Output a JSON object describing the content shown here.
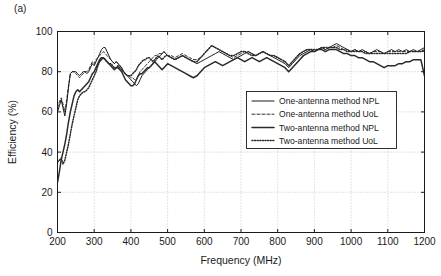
{
  "figure": {
    "panel_label": "(a)",
    "background_color": "#ffffff",
    "axis_color": "#1a1a1a",
    "grid_color": "#b0b0b0"
  },
  "chart_data": {
    "type": "line",
    "title": "",
    "panel_label": "(a)",
    "xlabel": "Frequency (MHz)",
    "ylabel": "Efficiency (%)",
    "xlim": [
      200,
      1200
    ],
    "ylim": [
      0,
      100
    ],
    "xticks": [
      200,
      300,
      400,
      500,
      600,
      700,
      800,
      900,
      1000,
      1100,
      1200
    ],
    "yticks": [
      0,
      20,
      40,
      60,
      80,
      100
    ],
    "grid": true,
    "grid_style": "dotted",
    "legend_position": "center-right",
    "x": [
      200,
      205,
      210,
      215,
      220,
      225,
      230,
      235,
      240,
      245,
      250,
      255,
      260,
      265,
      270,
      275,
      280,
      285,
      290,
      295,
      300,
      305,
      310,
      315,
      320,
      325,
      330,
      335,
      340,
      345,
      350,
      355,
      360,
      365,
      370,
      375,
      380,
      385,
      390,
      395,
      400,
      405,
      410,
      415,
      420,
      425,
      430,
      435,
      440,
      445,
      450,
      455,
      460,
      465,
      470,
      475,
      480,
      485,
      490,
      495,
      500,
      510,
      520,
      530,
      540,
      550,
      560,
      570,
      580,
      590,
      600,
      610,
      620,
      630,
      640,
      650,
      660,
      670,
      680,
      690,
      700,
      710,
      720,
      730,
      740,
      750,
      760,
      770,
      780,
      790,
      800,
      810,
      820,
      830,
      840,
      850,
      860,
      870,
      880,
      890,
      900,
      910,
      920,
      930,
      940,
      950,
      960,
      970,
      980,
      990,
      1000,
      1010,
      1020,
      1030,
      1040,
      1050,
      1060,
      1070,
      1080,
      1090,
      1100,
      1110,
      1120,
      1130,
      1140,
      1150,
      1160,
      1170,
      1180,
      1190,
      1200
    ],
    "series": [
      {
        "name": "One-antenna method NPL",
        "style": "solid",
        "color": "#1a1a1a",
        "width": 1.0,
        "values": [
          60,
          63,
          66,
          62,
          58,
          64,
          72,
          79,
          80,
          80,
          80,
          79,
          78,
          79,
          80,
          80,
          79,
          80,
          82,
          84,
          83,
          85,
          87,
          89,
          91,
          92,
          92,
          90,
          88,
          86,
          85,
          84,
          85,
          84,
          83,
          82,
          80,
          79,
          78,
          77,
          76,
          75,
          74,
          73,
          74,
          76,
          78,
          79,
          80,
          81,
          82,
          83,
          84,
          85,
          86,
          87,
          88,
          89,
          90,
          89,
          88,
          87,
          86,
          87,
          88,
          87,
          86,
          85,
          84,
          85,
          86,
          87,
          88,
          89,
          90,
          89,
          88,
          87,
          86,
          87,
          88,
          89,
          90,
          89,
          88,
          89,
          90,
          89,
          88,
          87,
          86,
          85,
          84,
          82,
          84,
          86,
          88,
          89,
          90,
          91,
          90,
          91,
          92,
          91,
          92,
          93,
          94,
          93,
          92,
          91,
          90,
          91,
          90,
          91,
          90,
          89,
          90,
          91,
          90,
          89,
          90,
          91,
          90,
          91,
          90,
          91,
          90,
          91,
          90,
          91,
          92
        ]
      },
      {
        "name": "One-antenna method UoL",
        "style": "dashed",
        "color": "#1a1a1a",
        "width": 0.9,
        "values": [
          62,
          65,
          67,
          64,
          60,
          66,
          73,
          79,
          80,
          80,
          79,
          78,
          77,
          78,
          79,
          80,
          80,
          81,
          83,
          85,
          84,
          86,
          87,
          88,
          89,
          90,
          89,
          88,
          87,
          86,
          85,
          84,
          85,
          84,
          83,
          82,
          80,
          79,
          78,
          78,
          77,
          77,
          76,
          76,
          78,
          80,
          81,
          82,
          83,
          84,
          85,
          86,
          87,
          88,
          88,
          89,
          89,
          89,
          90,
          89,
          88,
          88,
          87,
          88,
          89,
          88,
          87,
          86,
          86,
          87,
          89,
          91,
          93,
          92,
          91,
          90,
          89,
          88,
          87,
          88,
          89,
          90,
          90,
          89,
          88,
          89,
          90,
          89,
          88,
          88,
          87,
          86,
          85,
          83,
          85,
          87,
          89,
          90,
          91,
          91,
          90,
          91,
          92,
          91,
          92,
          92,
          93,
          92,
          91,
          91,
          90,
          91,
          90,
          90,
          90,
          89,
          90,
          90,
          90,
          89,
          90,
          90,
          90,
          90,
          90,
          90,
          90,
          90,
          90,
          90,
          90
        ]
      },
      {
        "name": "Two-antenna method NPL",
        "style": "solid",
        "color": "#2a2a2a",
        "width": 1.5,
        "values": [
          25,
          30,
          36,
          40,
          44,
          49,
          55,
          60,
          64,
          68,
          70,
          71,
          70,
          71,
          72,
          73,
          74,
          75,
          77,
          79,
          80,
          82,
          84,
          86,
          87,
          87,
          86,
          85,
          84,
          83,
          82,
          81,
          82,
          82,
          81,
          80,
          78,
          76,
          75,
          74,
          73,
          73,
          74,
          76,
          78,
          79,
          79,
          80,
          81,
          82,
          82,
          83,
          84,
          85,
          84,
          83,
          82,
          81,
          82,
          83,
          84,
          83,
          82,
          81,
          80,
          79,
          78,
          77,
          78,
          80,
          82,
          83,
          84,
          85,
          84,
          83,
          84,
          85,
          86,
          87,
          86,
          85,
          86,
          87,
          86,
          85,
          86,
          87,
          86,
          85,
          84,
          83,
          82,
          80,
          82,
          84,
          86,
          88,
          89,
          90,
          90,
          91,
          91,
          90,
          91,
          91,
          91,
          90,
          89,
          89,
          88,
          88,
          87,
          87,
          86,
          85,
          85,
          84,
          83,
          82,
          83,
          83,
          83,
          84,
          84,
          85,
          85,
          86,
          86,
          86,
          78
        ]
      },
      {
        "name": "Two-antenna method UoL",
        "style": "dotted",
        "color": "#2a2a2a",
        "width": 1.5,
        "values": [
          35,
          36,
          37,
          34,
          36,
          40,
          44,
          49,
          54,
          58,
          62,
          66,
          68,
          69,
          70,
          70,
          71,
          72,
          74,
          76,
          78,
          80,
          83,
          85,
          86,
          87,
          86,
          85,
          84,
          84,
          83,
          82,
          82,
          83,
          82,
          81,
          80,
          79,
          78,
          78,
          78,
          79,
          80,
          81,
          83,
          84,
          85,
          86,
          86,
          87,
          87,
          86,
          85,
          86,
          87,
          88,
          87,
          86,
          87,
          88,
          88,
          87,
          86,
          87,
          88,
          87,
          86,
          85,
          85,
          87,
          89,
          91,
          93,
          92,
          91,
          90,
          89,
          88,
          88,
          89,
          90,
          90,
          89,
          88,
          88,
          89,
          90,
          89,
          88,
          88,
          87,
          86,
          85,
          83,
          85,
          87,
          89,
          90,
          91,
          91,
          91,
          91,
          92,
          92,
          92,
          92,
          92,
          91,
          91,
          90,
          90,
          90,
          90,
          90,
          89,
          89,
          89,
          89,
          89,
          89,
          89,
          89,
          89,
          89,
          89,
          89,
          90,
          90,
          90,
          90,
          91
        ]
      }
    ]
  },
  "legend": {
    "entries": [
      {
        "label": "One-antenna method NPL",
        "style": "solid"
      },
      {
        "label": "One-antenna method UoL",
        "style": "dashed"
      },
      {
        "label": "Two-antenna method NPL",
        "style": "solid-thick"
      },
      {
        "label": "Two-antenna method UoL",
        "style": "dotted"
      }
    ]
  }
}
